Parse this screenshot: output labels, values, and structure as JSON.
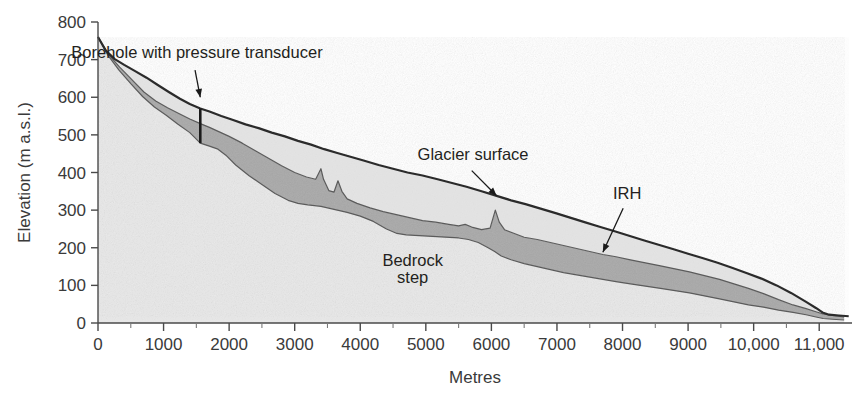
{
  "figure": {
    "name": "glacier-longitudinal-profile"
  },
  "axes": {
    "x": {
      "title": "Metres",
      "min": 0,
      "max": 11500,
      "tick_labels": [
        "0",
        "1000",
        "2000",
        "3000",
        "4000",
        "5000",
        "6000",
        "7000",
        "8000",
        "9000",
        "10,000",
        "11,000"
      ],
      "tick_values": [
        0,
        1000,
        2000,
        3000,
        4000,
        5000,
        6000,
        7000,
        8000,
        9000,
        10000,
        11000
      ],
      "minor_tick_values": [
        500,
        1500,
        2500,
        3500,
        4500,
        5500,
        6500,
        7500,
        8500,
        9500,
        10500
      ]
    },
    "y": {
      "title": "Elevation (m a.s.l.)",
      "min": 0,
      "max": 800,
      "tick_labels": [
        "0",
        "100",
        "200",
        "300",
        "400",
        "500",
        "600",
        "700",
        "800"
      ],
      "tick_values": [
        0,
        100,
        200,
        300,
        400,
        500,
        600,
        700,
        800
      ]
    }
  },
  "annotations": [
    {
      "id": "borehole",
      "label": "Borehole with pressure transducer",
      "text_x": 1510,
      "text_y": 705,
      "anchor": "middle",
      "arrow_from_x": 1480,
      "arrow_from_y": 672,
      "arrow_to_x": 1560,
      "arrow_to_y": 600
    },
    {
      "id": "glacier-surface",
      "label": "Glacier surface",
      "text_x": 5720,
      "text_y": 432,
      "anchor": "middle",
      "arrow_from_x": 5700,
      "arrow_from_y": 405,
      "arrow_to_x": 6080,
      "arrow_to_y": 338
    },
    {
      "id": "irh",
      "label": "IRH",
      "text_x": 8070,
      "text_y": 330,
      "anchor": "middle",
      "arrow_from_x": 8010,
      "arrow_from_y": 305,
      "arrow_to_x": 7700,
      "arrow_to_y": 188
    },
    {
      "id": "bedrock-step",
      "label_line1": "Bedrock",
      "label_line2": "step",
      "text_x": 4800,
      "text_y1": 152,
      "text_y2": 105,
      "anchor": "middle"
    }
  ],
  "borehole": {
    "x": 1560,
    "top_elevation": 570,
    "bottom_elevation": 478
  },
  "colors": {
    "glacier_surface_line": "#2b2b2b",
    "ice_light_fill": "#e3e3e3",
    "irh_dark_fill": "#a8a8a8",
    "bedrock_fill": "#e8e8e8",
    "axis": "#4a4a4a",
    "text": "#231f20",
    "background": "#ffffff"
  },
  "chart_data": {
    "type": "area",
    "title": "",
    "xlabel": "Metres",
    "ylabel": "Elevation (m a.s.l.)",
    "xlim": [
      0,
      11500
    ],
    "ylim": [
      0,
      800
    ],
    "grid": false,
    "legend": "none",
    "series": [
      {
        "name": "Glacier surface",
        "x": [
          0,
          120,
          250,
          400,
          560,
          740,
          900,
          1080,
          1250,
          1400,
          1560,
          1700,
          1880,
          2050,
          2250,
          2450,
          2650,
          2850,
          3050,
          3250,
          3450,
          3650,
          3850,
          4050,
          4280,
          4500,
          4720,
          4950,
          5180,
          5400,
          5620,
          5850,
          6080,
          6300,
          6520,
          6750,
          6980,
          7200,
          7420,
          7650,
          7880,
          8100,
          8320,
          8550,
          8780,
          9000,
          9230,
          9450,
          9680,
          9900,
          10120,
          10350,
          10570,
          10800,
          10950,
          11050,
          11150,
          11300,
          11450
        ],
        "y": [
          760,
          724,
          702,
          686,
          670,
          652,
          634,
          614,
          596,
          582,
          570,
          562,
          550,
          540,
          528,
          518,
          506,
          496,
          484,
          474,
          462,
          452,
          442,
          432,
          420,
          410,
          400,
          392,
          382,
          372,
          362,
          350,
          338,
          326,
          316,
          304,
          292,
          280,
          268,
          256,
          244,
          232,
          220,
          208,
          196,
          184,
          172,
          160,
          146,
          132,
          118,
          100,
          80,
          56,
          40,
          28,
          22,
          20,
          18
        ]
      },
      {
        "name": "IRH (internal reflecting horizon) upper boundary",
        "x": [
          0,
          150,
          330,
          520,
          700,
          880,
          1060,
          1240,
          1400,
          1560,
          1700,
          1850,
          2000,
          2200,
          2400,
          2600,
          2800,
          3000,
          3180,
          3320,
          3400,
          3440,
          3520,
          3600,
          3660,
          3720,
          3800,
          3950,
          4150,
          4350,
          4550,
          4750,
          4950,
          5150,
          5350,
          5500,
          5600,
          5700,
          5850,
          5980,
          6060,
          6120,
          6200,
          6320,
          6500,
          6700,
          6900,
          7100,
          7300,
          7500,
          7700,
          7900,
          8120,
          8350,
          8580,
          8800,
          9020,
          9250,
          9480,
          9700,
          9920,
          10150,
          10380,
          10600,
          10800,
          10950,
          11060,
          11200,
          11380
        ],
        "y": [
          760,
          716,
          680,
          646,
          614,
          590,
          572,
          556,
          542,
          530,
          520,
          508,
          496,
          478,
          458,
          438,
          418,
          400,
          388,
          382,
          410,
          382,
          352,
          348,
          378,
          350,
          330,
          318,
          306,
          296,
          288,
          280,
          272,
          268,
          262,
          258,
          262,
          255,
          248,
          252,
          300,
          268,
          248,
          240,
          228,
          222,
          214,
          206,
          198,
          190,
          182,
          176,
          168,
          160,
          152,
          144,
          136,
          126,
          116,
          104,
          92,
          78,
          62,
          48,
          38,
          30,
          24,
          20,
          16
        ]
      },
      {
        "name": "Bedrock surface",
        "x": [
          0,
          150,
          320,
          500,
          680,
          860,
          1040,
          1220,
          1400,
          1560,
          1700,
          1830,
          1950,
          2100,
          2300,
          2500,
          2700,
          2900,
          3050,
          3200,
          3400,
          3600,
          3800,
          4000,
          4200,
          4400,
          4560,
          4700,
          4900,
          5100,
          5300,
          5500,
          5650,
          5800,
          5950,
          6050,
          6150,
          6300,
          6500,
          6700,
          6900,
          7100,
          7300,
          7500,
          7700,
          7900,
          8120,
          8350,
          8580,
          8800,
          9020,
          9250,
          9480,
          9700,
          9920,
          10150,
          10380,
          10600,
          10800,
          10950,
          11060,
          11200,
          11380
        ],
        "y": [
          760,
          712,
          672,
          636,
          602,
          574,
          552,
          528,
          506,
          478,
          470,
          462,
          446,
          420,
          392,
          368,
          344,
          326,
          318,
          314,
          310,
          302,
          294,
          284,
          270,
          250,
          238,
          234,
          232,
          230,
          228,
          226,
          222,
          214,
          200,
          190,
          178,
          168,
          158,
          150,
          142,
          134,
          128,
          122,
          116,
          110,
          104,
          98,
          92,
          86,
          80,
          72,
          64,
          56,
          48,
          42,
          34,
          28,
          22,
          16,
          12,
          10,
          8
        ]
      }
    ]
  }
}
